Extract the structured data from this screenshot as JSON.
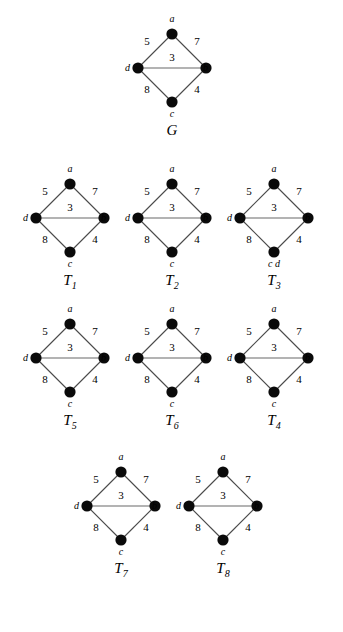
{
  "figure": {
    "kind": "weighted-graph-and-spanning-trees",
    "vertex_labels": {
      "top": "a",
      "left": "d",
      "right": "b",
      "bottom": "c"
    },
    "edge_weights": {
      "a_d": "5",
      "a_b": "7",
      "d_b": "3",
      "d_c": "8",
      "c_b": "4"
    }
  },
  "chart_data": {
    "type": "diagram",
    "title": "",
    "graphs": [
      {
        "name": "G",
        "name_base": "G",
        "name_sub": "",
        "vertices": [
          "a",
          "b",
          "c",
          "d"
        ],
        "edges": [
          {
            "from": "a",
            "to": "d",
            "weight": 5
          },
          {
            "from": "a",
            "to": "b",
            "weight": 7
          },
          {
            "from": "d",
            "to": "b",
            "weight": 3
          },
          {
            "from": "d",
            "to": "c",
            "weight": 8
          },
          {
            "from": "c",
            "to": "b",
            "weight": 4
          }
        ],
        "bottom_label": "c"
      },
      {
        "name": "T1",
        "name_base": "T",
        "name_sub": "1",
        "vertices": [
          "a",
          "b",
          "c",
          "d"
        ],
        "edges": [
          {
            "from": "a",
            "to": "d",
            "weight": 5
          },
          {
            "from": "a",
            "to": "b",
            "weight": 7
          },
          {
            "from": "d",
            "to": "b",
            "weight": 3
          },
          {
            "from": "d",
            "to": "c",
            "weight": 8
          },
          {
            "from": "c",
            "to": "b",
            "weight": 4
          }
        ],
        "bottom_label": "c"
      },
      {
        "name": "T2",
        "name_base": "T",
        "name_sub": "2",
        "vertices": [
          "a",
          "b",
          "c",
          "d"
        ],
        "edges": [
          {
            "from": "a",
            "to": "d",
            "weight": 5
          },
          {
            "from": "a",
            "to": "b",
            "weight": 7
          },
          {
            "from": "d",
            "to": "b",
            "weight": 3
          },
          {
            "from": "d",
            "to": "c",
            "weight": 8
          },
          {
            "from": "c",
            "to": "b",
            "weight": 4
          }
        ],
        "bottom_label": "c"
      },
      {
        "name": "T3",
        "name_base": "T",
        "name_sub": "3",
        "vertices": [
          "a",
          "b",
          "c",
          "d"
        ],
        "edges": [
          {
            "from": "a",
            "to": "d",
            "weight": 5
          },
          {
            "from": "a",
            "to": "b",
            "weight": 7
          },
          {
            "from": "d",
            "to": "b",
            "weight": 3
          },
          {
            "from": "d",
            "to": "c",
            "weight": 8
          },
          {
            "from": "c",
            "to": "b",
            "weight": 4
          }
        ],
        "bottom_label": "c d"
      },
      {
        "name": "T5",
        "name_base": "T",
        "name_sub": "5",
        "vertices": [
          "a",
          "b",
          "c",
          "d"
        ],
        "edges": [
          {
            "from": "a",
            "to": "d",
            "weight": 5
          },
          {
            "from": "a",
            "to": "b",
            "weight": 7
          },
          {
            "from": "d",
            "to": "b",
            "weight": 3
          },
          {
            "from": "d",
            "to": "c",
            "weight": 8
          },
          {
            "from": "c",
            "to": "b",
            "weight": 4
          }
        ],
        "bottom_label": "c"
      },
      {
        "name": "T6",
        "name_base": "T",
        "name_sub": "6",
        "vertices": [
          "a",
          "b",
          "c",
          "d"
        ],
        "edges": [
          {
            "from": "a",
            "to": "d",
            "weight": 5
          },
          {
            "from": "a",
            "to": "b",
            "weight": 7
          },
          {
            "from": "d",
            "to": "b",
            "weight": 3
          },
          {
            "from": "d",
            "to": "c",
            "weight": 8
          },
          {
            "from": "c",
            "to": "b",
            "weight": 4
          }
        ],
        "bottom_label": "c"
      },
      {
        "name": "T4",
        "name_base": "T",
        "name_sub": "4",
        "vertices": [
          "a",
          "b",
          "c",
          "d"
        ],
        "edges": [
          {
            "from": "a",
            "to": "d",
            "weight": 5
          },
          {
            "from": "a",
            "to": "b",
            "weight": 7
          },
          {
            "from": "d",
            "to": "b",
            "weight": 3
          },
          {
            "from": "d",
            "to": "c",
            "weight": 8
          },
          {
            "from": "c",
            "to": "b",
            "weight": 4
          }
        ],
        "bottom_label": "c"
      },
      {
        "name": "T7",
        "name_base": "T",
        "name_sub": "7",
        "vertices": [
          "a",
          "b",
          "c",
          "d"
        ],
        "edges": [
          {
            "from": "a",
            "to": "d",
            "weight": 5
          },
          {
            "from": "a",
            "to": "b",
            "weight": 7
          },
          {
            "from": "d",
            "to": "b",
            "weight": 3
          },
          {
            "from": "d",
            "to": "c",
            "weight": 8
          },
          {
            "from": "c",
            "to": "b",
            "weight": 4
          }
        ],
        "bottom_label": "c"
      },
      {
        "name": "T8",
        "name_base": "T",
        "name_sub": "8",
        "vertices": [
          "a",
          "b",
          "c",
          "d"
        ],
        "edges": [
          {
            "from": "a",
            "to": "d",
            "weight": 5
          },
          {
            "from": "a",
            "to": "b",
            "weight": 7
          },
          {
            "from": "d",
            "to": "b",
            "weight": 3
          },
          {
            "from": "d",
            "to": "c",
            "weight": 8
          },
          {
            "from": "c",
            "to": "b",
            "weight": 4
          }
        ],
        "bottom_label": "c"
      }
    ]
  },
  "colors": {
    "node": "#0a0a0a",
    "edge": "#4a4a4a",
    "edge_light": "#9a9a9a",
    "text": "#000000",
    "background": "#ffffff"
  },
  "layout": {
    "positions": [
      {
        "name": "G",
        "x": 117,
        "y": 14
      },
      {
        "name": "T1",
        "x": 15,
        "y": 164
      },
      {
        "name": "T2",
        "x": 117,
        "y": 164
      },
      {
        "name": "T3",
        "x": 219,
        "y": 164
      },
      {
        "name": "T5",
        "x": 15,
        "y": 304
      },
      {
        "name": "T6",
        "x": 117,
        "y": 304
      },
      {
        "name": "T4",
        "x": 219,
        "y": 304
      },
      {
        "name": "T7",
        "x": 66,
        "y": 452
      },
      {
        "name": "T8",
        "x": 168,
        "y": 452
      }
    ]
  }
}
